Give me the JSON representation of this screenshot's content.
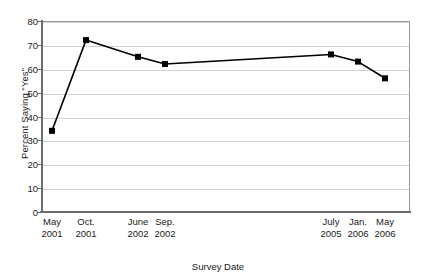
{
  "chart_data": {
    "type": "line",
    "title": "",
    "xlabel": "Survey Date",
    "ylabel": "Percent Saying “Yes”",
    "categories": [
      "May 2001",
      "Oct. 2001",
      "June 2002",
      "Sep. 2002",
      "July 2005",
      "Jan. 2006",
      "May 2006"
    ],
    "category_lines": [
      {
        "month": "May",
        "year": "2001"
      },
      {
        "month": "Oct.",
        "year": "2001"
      },
      {
        "month": "June",
        "year": "2002"
      },
      {
        "month": "Sep.",
        "year": "2002"
      },
      {
        "month": "July",
        "year": "2005"
      },
      {
        "month": "Jan.",
        "year": "2006"
      },
      {
        "month": "May",
        "year": "2006"
      }
    ],
    "values": [
      34,
      72,
      65,
      62,
      66,
      63,
      56
    ],
    "x_positions_px": [
      52,
      86,
      138,
      165,
      331,
      358,
      385
    ],
    "ylim": [
      0,
      80
    ],
    "ytick_values": [
      0,
      10,
      20,
      30,
      40,
      50,
      60,
      70,
      80
    ],
    "ytick_labels": [
      "0",
      "10",
      "20",
      "30",
      "40",
      "50",
      "60",
      "70",
      "80"
    ],
    "grid": true,
    "legend": "none",
    "series_color": "#000000",
    "marker": "square",
    "marker_size": 6,
    "line_width": 1.6,
    "gridline_color": "#cfcfcf",
    "axis_color": "#6b6b6b",
    "plot_border_color": "#9a9a9a",
    "background": "#ffffff"
  }
}
